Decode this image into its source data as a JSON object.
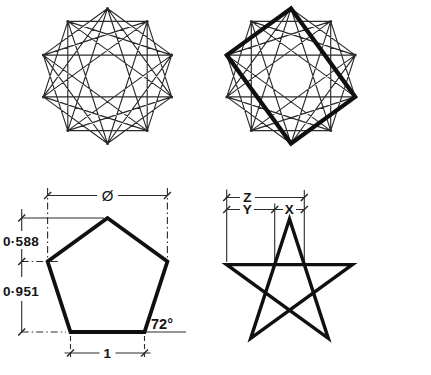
{
  "colors": {
    "ink": "#2b2b2b",
    "bold_ink": "#101010",
    "paper": "#ffffff"
  },
  "pentagon_dims": {
    "diameter_symbol": "Ø",
    "height_upper": "0·588",
    "height_lower": "0·951",
    "corner_angle": "72°",
    "base_length": "1"
  },
  "pentagram_dims": {
    "span_z": "Z",
    "span_y": "Y",
    "span_x": "X"
  }
}
